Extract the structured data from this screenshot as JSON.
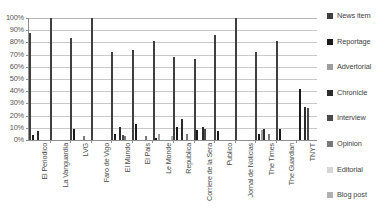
{
  "chart_data": {
    "type": "bar",
    "title": "",
    "xlabel": "",
    "ylabel": "",
    "ylim": [
      0,
      100
    ],
    "grid": true,
    "legend_position": "right",
    "y_ticks": [
      "100%",
      "90%",
      "80%",
      "70%",
      "60%",
      "50%",
      "40%",
      "30%",
      "20%",
      "10%",
      "0%"
    ],
    "y_tick_values": [
      100,
      90,
      80,
      70,
      60,
      50,
      40,
      30,
      20,
      10,
      0
    ],
    "categories": [
      "El Periodico",
      "La Vanguardia",
      "LVG",
      "Faro de Vigo",
      "El Mundo",
      "El Pais",
      "Le Monde",
      "Republica",
      "Corriere de la Sera",
      "Publico",
      "Jornal de Noticias",
      "The Times",
      "The Guardian",
      "TNYT"
    ],
    "series": [
      {
        "name": "News item",
        "color": "#3f3f3f",
        "values": [
          88,
          100,
          84,
          100,
          72,
          74,
          81,
          68,
          66,
          86,
          100,
          72,
          81,
          0
        ]
      },
      {
        "name": "Reportage",
        "color": "#1a1a1a",
        "values": [
          4,
          0,
          9,
          0,
          5,
          13,
          2,
          11,
          8,
          7,
          0,
          5,
          9,
          42
        ]
      },
      {
        "name": "Advertorial",
        "color": "#9e9e9e",
        "values": [
          0,
          0,
          0,
          0,
          0,
          0,
          5,
          0,
          0,
          0,
          0,
          8,
          0,
          0
        ]
      },
      {
        "name": "Chronicle",
        "color": "#2b2b2b",
        "values": [
          7,
          0,
          0,
          0,
          11,
          0,
          0,
          17,
          11,
          0,
          0,
          9,
          0,
          27
        ]
      },
      {
        "name": "Interview",
        "color": "#4a4a4a",
        "values": [
          0,
          0,
          0,
          0,
          4,
          0,
          0,
          0,
          9,
          0,
          0,
          0,
          0,
          26
        ]
      },
      {
        "name": "Opinion",
        "color": "#7a7a7a",
        "values": [
          0,
          0,
          3,
          0,
          3,
          3,
          0,
          5,
          0,
          0,
          0,
          5,
          0,
          0
        ]
      },
      {
        "name": "Editorial",
        "color": "#d6d6d6",
        "values": [
          0,
          0,
          0,
          0,
          0,
          0,
          0,
          0,
          0,
          0,
          0,
          0,
          0,
          0
        ]
      },
      {
        "name": "Blog post",
        "color": "#b0b0b0",
        "values": [
          0,
          0,
          0,
          0,
          0,
          0,
          3,
          0,
          0,
          0,
          0,
          0,
          0,
          0
        ]
      }
    ]
  }
}
